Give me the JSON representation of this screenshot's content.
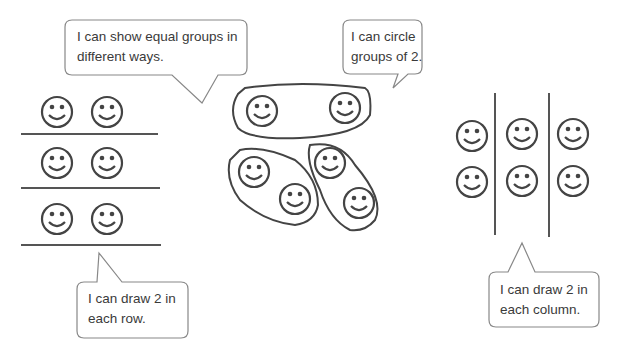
{
  "bubbles": {
    "equal_groups": "I can show equal groups in different ways.",
    "circle_groups": "I can circle groups of 2.",
    "draw_rows": "I can draw 2 in each row.",
    "draw_columns": "I can draw 2 in each column."
  },
  "groups": {
    "rows": {
      "count": 3,
      "per_group": 2
    },
    "circles": {
      "count": 3,
      "per_group": 2
    },
    "columns": {
      "count": 3,
      "per_group": 2
    }
  },
  "colors": {
    "stroke": "#444444",
    "bubble_border": "#888888",
    "text": "#3a3a3a"
  }
}
